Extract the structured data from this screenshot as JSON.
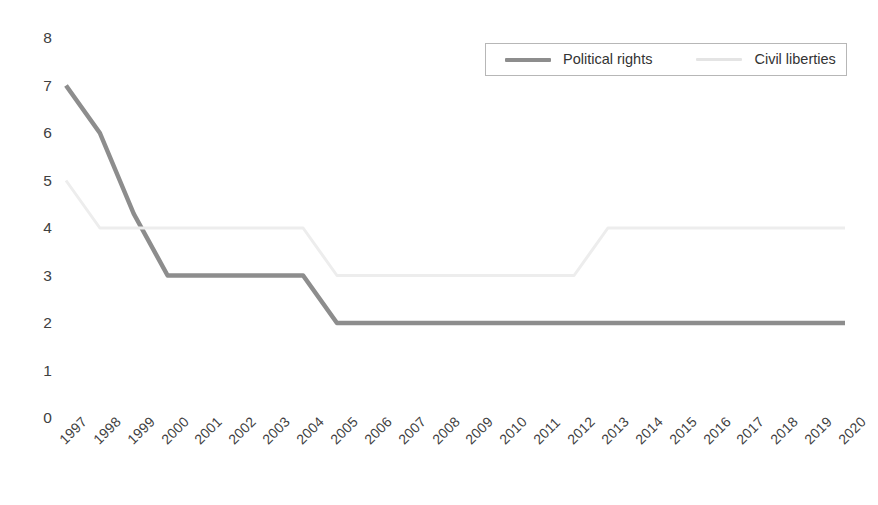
{
  "chart_data": {
    "type": "line",
    "title": "",
    "subtitle": "",
    "xlabel": "",
    "ylabel": "",
    "grid": false,
    "legend_position": "top-right",
    "ylim": [
      0,
      8
    ],
    "y_ticks": [
      8,
      7,
      6,
      5,
      4,
      3,
      2,
      1,
      0
    ],
    "categories": [
      "1997",
      "1998",
      "1999",
      "2000",
      "2001",
      "2002",
      "2003",
      "2004",
      "2005",
      "2006",
      "2007",
      "2008",
      "2009",
      "2010",
      "2011",
      "2012",
      "2013",
      "2014",
      "2015",
      "2016",
      "2017",
      "2018",
      "2019",
      "2020"
    ],
    "series": [
      {
        "name": "Political rights",
        "color": "#8d8d8d",
        "width": 4.5,
        "values": [
          7,
          6,
          4.3,
          3,
          3,
          3,
          3,
          3,
          2,
          2,
          2,
          2,
          2,
          2,
          2,
          2,
          2,
          2,
          2,
          2,
          2,
          2,
          2,
          2
        ]
      },
      {
        "name": "Civil liberties",
        "color": "#ededed",
        "width": 3,
        "values": [
          5,
          4,
          4,
          4,
          4,
          4,
          4,
          4,
          3,
          3,
          3,
          3,
          3,
          3,
          3,
          3,
          4,
          4,
          4,
          4,
          4,
          4,
          4,
          4
        ]
      }
    ]
  },
  "legend": {
    "entries": [
      {
        "label": "Political rights",
        "color": "#8d8d8d"
      },
      {
        "label": "Civil liberties",
        "color": "#e4e4e4"
      }
    ]
  },
  "axes": {
    "y_labels": [
      "8",
      "7",
      "6",
      "5",
      "4",
      "3",
      "2",
      "1",
      "0"
    ],
    "x_labels": [
      "1997",
      "1998",
      "1999",
      "2000",
      "2001",
      "2002",
      "2003",
      "2004",
      "2005",
      "2006",
      "2007",
      "2008",
      "2009",
      "2010",
      "2011",
      "2012",
      "2013",
      "2014",
      "2015",
      "2016",
      "2017",
      "2018",
      "2019",
      "2020"
    ]
  }
}
